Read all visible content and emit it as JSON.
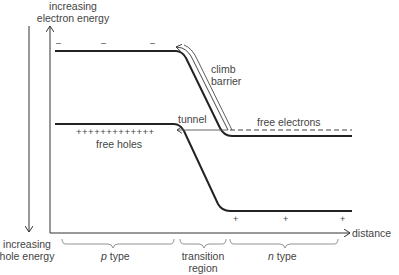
{
  "diagram": {
    "type": "energy band diagram of p-n junction",
    "axes": {
      "y_up_label": "increasing electron energy",
      "y_up_line1": "increasing",
      "y_up_line2": "electron energy",
      "y_down_line1": "increasing",
      "y_down_line2": "hole energy",
      "x_label": "distance"
    },
    "annotations": {
      "climb_barrier_line1": "climb",
      "climb_barrier_line2": "barrier",
      "tunnel": "tunnel",
      "free_electrons": "free electrons",
      "free_holes": "free holes",
      "holes_plus_signs": "+++++++++++++",
      "electron_minus_signs": [
        "–",
        "–",
        "–"
      ],
      "donor_plus_signs": [
        "+",
        "+",
        "+"
      ]
    },
    "regions": [
      {
        "label_prefix": "p",
        "label_suffix": " type"
      },
      {
        "label_line1": "transition",
        "label_line2": "region"
      },
      {
        "label_prefix": "n",
        "label_suffix": " type"
      }
    ]
  }
}
